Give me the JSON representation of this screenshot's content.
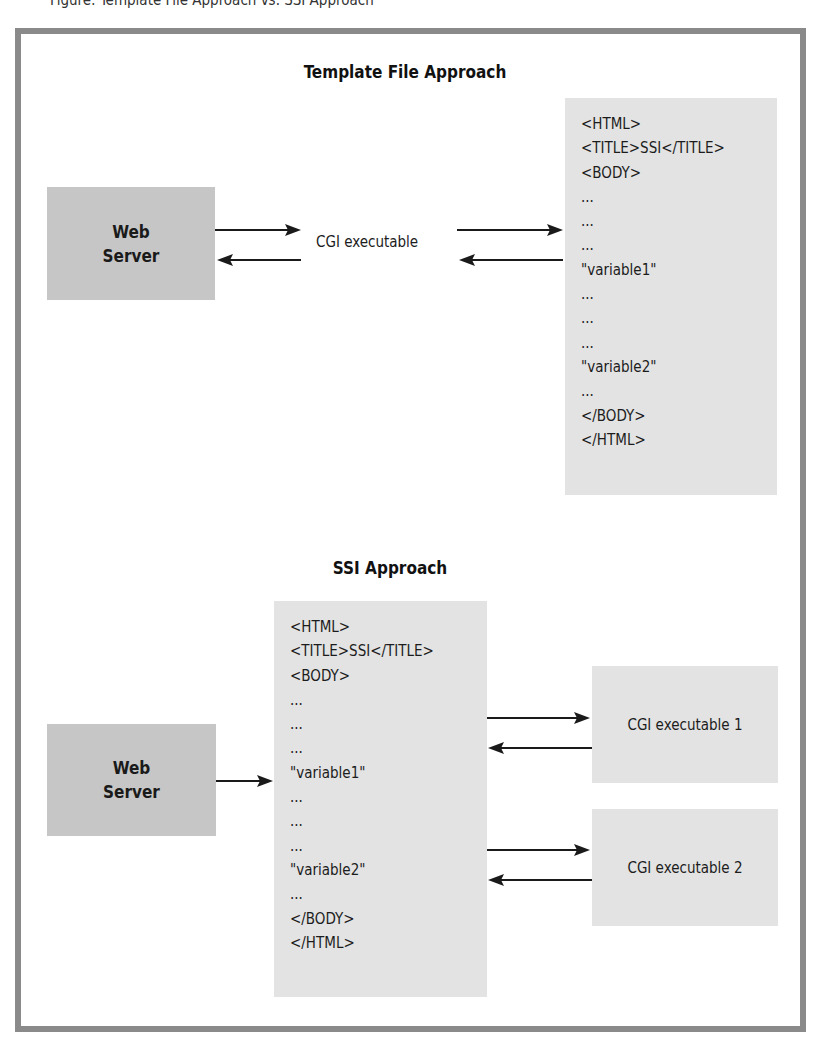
{
  "caption_clipped": "Figure: Template File Approach vs. SSI Approach",
  "template_section": {
    "title": "Template File Approach",
    "web_server": {
      "label_line1": "Web",
      "label_line2": "Server"
    },
    "cgi_label": "CGI executable",
    "document_lines": [
      "<HTML>",
      "<TITLE>SSI</TITLE>",
      "<BODY>",
      "...",
      "...",
      "...",
      "\"variable1\"",
      "...",
      "...",
      "...",
      "\"variable2\"",
      "...",
      "</BODY>",
      "</HTML>"
    ]
  },
  "ssi_section": {
    "title": "SSI Approach",
    "web_server": {
      "label_line1": "Web",
      "label_line2": "Server"
    },
    "document_lines": [
      "<HTML>",
      "<TITLE>SSI</TITLE>",
      "<BODY>",
      "...",
      "...",
      "...",
      "\"variable1\"",
      "...",
      "...",
      "...",
      "\"variable2\"",
      "...",
      "</BODY>",
      "</HTML>"
    ],
    "cgi_boxes": [
      {
        "label": "CGI executable 1"
      },
      {
        "label": "CGI executable 2"
      }
    ]
  },
  "colors": {
    "frame_border": "#8a8a8a",
    "server_box": "#c6c6c6",
    "doc_box": "#e3e3e3",
    "arrow": "#1a1a1a"
  }
}
